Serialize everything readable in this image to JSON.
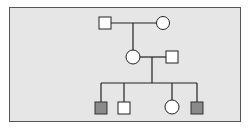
{
  "diagram": {
    "type": "pedigree-chart",
    "background": "#e6e6e6",
    "frame_color": "#555555",
    "affected_fill": "#8a8a8a",
    "unaffected_fill": "#ffffff",
    "line_color": "#222222",
    "generations": [
      {
        "label": "I",
        "individuals": [
          {
            "id": "I-1",
            "sex": "male",
            "affected": false
          },
          {
            "id": "I-2",
            "sex": "female",
            "affected": false
          }
        ]
      },
      {
        "label": "II",
        "individuals": [
          {
            "id": "II-1",
            "sex": "female",
            "affected": false,
            "parents": "I-1 x I-2"
          },
          {
            "id": "II-2",
            "sex": "male",
            "affected": false
          }
        ]
      },
      {
        "label": "III",
        "individuals": [
          {
            "id": "III-1",
            "sex": "male",
            "affected": true,
            "parents": "II-1 x II-2"
          },
          {
            "id": "III-2",
            "sex": "male",
            "affected": false,
            "parents": "II-1 x II-2"
          },
          {
            "id": "III-3",
            "sex": "female",
            "affected": false,
            "parents": "II-1 x II-2"
          },
          {
            "id": "III-4",
            "sex": "male",
            "affected": true,
            "parents": "II-1 x II-2"
          }
        ]
      }
    ]
  }
}
